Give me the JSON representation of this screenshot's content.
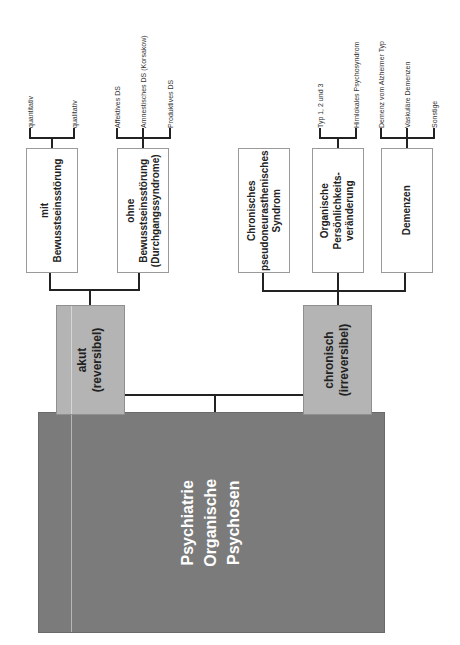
{
  "root": {
    "line1": "Psychiatrie",
    "line2": "Organische",
    "line3": "Psychosen"
  },
  "branches": [
    {
      "label": "akut\n(reversibel)",
      "children": [
        {
          "label": "mit\nBewusstseinsstörung",
          "leaves": [
            "quantitativ",
            "qualitativ"
          ]
        },
        {
          "label": "ohne\nBewusstseinsstörung\n(Durchgangssyndrome)",
          "leaves": [
            "Affektives DS",
            "Amnestisches DS (Korsakow)",
            "Produktives DS"
          ]
        }
      ]
    },
    {
      "label": "chronisch\n(irreversibel)",
      "children": [
        {
          "label": "Chronisches\npseudoneurasthenisches\nSyndrom",
          "leaves": []
        },
        {
          "label": "Organische\nPersönlichkeits-\nveränderung",
          "leaves": [
            "Typ 1, 2 und 3",
            "Hirnlokales Psychosyndrom"
          ]
        },
        {
          "label": "Demenzen",
          "leaves": [
            "Demenz vom Alzheimer Typ",
            "Vaskuläre Demenzen",
            "Sonstige"
          ]
        }
      ]
    }
  ],
  "colors": {
    "root": "#7b7b7b",
    "mid": "#b4b4b4",
    "leaf": "#ffffff",
    "line": "#222222"
  }
}
